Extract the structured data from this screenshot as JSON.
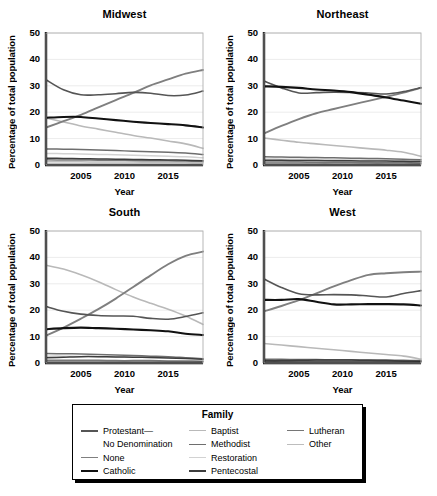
{
  "figure": {
    "ylabel": "Percentage of total population",
    "xlabel": "Year",
    "legend_title": "Family"
  },
  "axes": {
    "yticks": [
      "0",
      "10",
      "20",
      "30",
      "40",
      "50"
    ],
    "xticks": [
      "2005",
      "2010",
      "2015"
    ],
    "ylim": [
      0,
      50
    ],
    "xlim": [
      2001,
      2019
    ]
  },
  "legend": {
    "columns": [
      {
        "items": [
          {
            "label": "Protestant—",
            "label2": "No Denomination",
            "color": "#555555",
            "width": 2.0
          },
          {
            "label": "None",
            "color": "#7f7f7f",
            "width": 1.8
          },
          {
            "label": "Catholic",
            "color": "#111111",
            "width": 2.2
          }
        ]
      },
      {
        "items": [
          {
            "label": "Baptist",
            "color": "#b9b9b9",
            "width": 1.8
          },
          {
            "label": "Methodist",
            "color": "#6e6e6e",
            "width": 1.8
          },
          {
            "label": "Restoration",
            "color": "#d2d2d2",
            "width": 1.8
          },
          {
            "label": "Pentecostal",
            "color": "#3d3d3d",
            "width": 2.0
          }
        ]
      },
      {
        "items": [
          {
            "label": "Lutheran",
            "color": "#767676",
            "width": 1.8
          },
          {
            "label": "Other",
            "color": "#bdbdbd",
            "width": 1.8
          }
        ]
      }
    ]
  },
  "chart_data": {
    "type": "line",
    "title": "",
    "xlabel": "Year",
    "ylabel": "Percentage of total population",
    "xlim": [
      2001,
      2019
    ],
    "ylim": [
      0,
      50
    ],
    "grid": true,
    "legend_position": "bottom",
    "facets": [
      "Midwest",
      "Northeast",
      "South",
      "West"
    ],
    "x": [
      2001,
      2003,
      2005,
      2007,
      2009,
      2011,
      2013,
      2015,
      2017,
      2019
    ],
    "panels": [
      {
        "facet": "Midwest",
        "series": [
          {
            "name": "Protestant—No Denomination",
            "color": "#555555",
            "width": 1.6,
            "values": [
              32.3,
              28.5,
              26.6,
              26.6,
              27.0,
              27.5,
              27.2,
              26.3,
              26.5,
              28.0
            ]
          },
          {
            "name": "None",
            "color": "#7f7f7f",
            "width": 1.9,
            "values": [
              14.2,
              16.6,
              19.0,
              21.8,
              24.6,
              27.3,
              30.2,
              32.4,
              34.6,
              36.0
            ]
          },
          {
            "name": "Catholic",
            "color": "#111111",
            "width": 2.1,
            "values": [
              17.9,
              18.2,
              18.2,
              17.6,
              17.0,
              16.4,
              15.9,
              15.5,
              15.0,
              14.2
            ]
          },
          {
            "name": "Baptist",
            "color": "#b9b9b9",
            "width": 1.6,
            "values": [
              17.8,
              16.3,
              14.8,
              13.6,
              12.4,
              11.2,
              10.2,
              9.1,
              8.0,
              6.3
            ]
          },
          {
            "name": "Methodist",
            "color": "#6e6e6e",
            "width": 1.5,
            "values": [
              6.1,
              6.0,
              5.9,
              5.7,
              5.5,
              5.2,
              5.0,
              4.8,
              4.5,
              4.0
            ]
          },
          {
            "name": "Restoration",
            "color": "#d2d2d2",
            "width": 1.5,
            "values": [
              4.4,
              4.3,
              4.2,
              4.0,
              3.9,
              3.7,
              3.5,
              3.3,
              3.1,
              2.7
            ]
          },
          {
            "name": "Pentecostal",
            "color": "#3d3d3d",
            "width": 1.5,
            "values": [
              2.6,
              2.5,
              2.4,
              2.3,
              2.2,
              2.1,
              2.0,
              1.9,
              1.8,
              1.6
            ]
          },
          {
            "name": "Lutheran",
            "color": "#767676",
            "width": 1.5,
            "values": [
              2.0,
              1.9,
              1.9,
              1.8,
              1.8,
              1.7,
              1.6,
              1.6,
              1.5,
              1.4
            ]
          },
          {
            "name": "Other",
            "color": "#bdbdbd",
            "width": 1.5,
            "values": [
              1.2,
              1.2,
              1.2,
              1.1,
              1.1,
              1.1,
              1.0,
              1.0,
              1.0,
              0.9
            ]
          }
        ]
      },
      {
        "facet": "Northeast",
        "series": [
          {
            "name": "Protestant—No Denomination",
            "color": "#555555",
            "width": 1.6,
            "values": [
              31.8,
              29.2,
              27.3,
              27.4,
              27.6,
              27.5,
              27.3,
              26.9,
              27.8,
              29.3
            ]
          },
          {
            "name": "None",
            "color": "#7f7f7f",
            "width": 1.9,
            "values": [
              12.0,
              14.8,
              17.4,
              19.6,
              21.2,
              22.8,
              24.3,
              25.8,
              27.4,
              29.2
            ]
          },
          {
            "name": "Catholic",
            "color": "#111111",
            "width": 2.1,
            "values": [
              29.8,
              29.6,
              29.2,
              28.6,
              28.2,
              27.6,
              26.6,
              25.6,
              24.4,
              23.2
            ]
          },
          {
            "name": "Baptist",
            "color": "#b9b9b9",
            "width": 1.6,
            "values": [
              10.2,
              9.4,
              8.6,
              8.0,
              7.4,
              6.8,
              6.2,
              5.6,
              4.8,
              3.3
            ]
          },
          {
            "name": "Methodist",
            "color": "#6e6e6e",
            "width": 1.5,
            "values": [
              3.1,
              3.0,
              2.9,
              2.8,
              2.7,
              2.6,
              2.5,
              2.4,
              2.2,
              2.0
            ]
          },
          {
            "name": "Restoration",
            "color": "#d2d2d2",
            "width": 1.5,
            "values": [
              2.3,
              2.2,
              2.2,
              2.1,
              2.0,
              1.9,
              1.9,
              1.8,
              1.7,
              1.6
            ]
          },
          {
            "name": "Pentecostal",
            "color": "#3d3d3d",
            "width": 1.5,
            "values": [
              1.8,
              1.8,
              1.7,
              1.7,
              1.6,
              1.6,
              1.5,
              1.5,
              1.4,
              1.3
            ]
          },
          {
            "name": "Lutheran",
            "color": "#767676",
            "width": 1.5,
            "values": [
              1.1,
              1.1,
              1.1,
              1.0,
              1.0,
              1.0,
              0.9,
              0.9,
              0.9,
              0.8
            ]
          },
          {
            "name": "Other",
            "color": "#bdbdbd",
            "width": 1.5,
            "values": [
              0.7,
              0.7,
              0.7,
              0.7,
              0.6,
              0.6,
              0.6,
              0.6,
              0.6,
              0.5
            ]
          }
        ]
      },
      {
        "facet": "South",
        "series": [
          {
            "name": "Protestant—No Denomination",
            "color": "#555555",
            "width": 1.6,
            "values": [
              21.4,
              19.6,
              18.5,
              18.0,
              17.8,
              17.7,
              16.9,
              16.6,
              17.6,
              19.0
            ]
          },
          {
            "name": "None",
            "color": "#7f7f7f",
            "width": 1.9,
            "values": [
              10.4,
              13.4,
              16.8,
              20.4,
              24.4,
              28.8,
              33.2,
              37.4,
              40.6,
              42.2
            ]
          },
          {
            "name": "Catholic",
            "color": "#111111",
            "width": 2.1,
            "values": [
              12.8,
              13.2,
              13.4,
              13.2,
              13.0,
              12.7,
              12.4,
              12.0,
              11.1,
              10.6
            ]
          },
          {
            "name": "Baptist",
            "color": "#b9b9b9",
            "width": 1.6,
            "values": [
              37.0,
              35.6,
              33.4,
              30.8,
              27.8,
              25.0,
              22.6,
              20.4,
              17.8,
              14.6
            ]
          },
          {
            "name": "Methodist",
            "color": "#6e6e6e",
            "width": 1.5,
            "values": [
              3.6,
              3.5,
              3.4,
              3.2,
              3.0,
              2.8,
              2.6,
              2.4,
              2.0,
              1.6
            ]
          },
          {
            "name": "Restoration",
            "color": "#d2d2d2",
            "width": 1.5,
            "values": [
              2.6,
              2.6,
              2.5,
              2.4,
              2.3,
              2.2,
              2.1,
              2.0,
              1.8,
              1.5
            ]
          },
          {
            "name": "Pentecostal",
            "color": "#3d3d3d",
            "width": 1.5,
            "values": [
              2.0,
              2.2,
              2.4,
              2.4,
              2.3,
              2.2,
              2.1,
              1.9,
              1.7,
              1.4
            ]
          },
          {
            "name": "Lutheran",
            "color": "#767676",
            "width": 1.5,
            "values": [
              1.0,
              1.0,
              1.0,
              1.0,
              0.9,
              0.9,
              0.9,
              0.8,
              0.8,
              0.7
            ]
          },
          {
            "name": "Other",
            "color": "#bdbdbd",
            "width": 1.5,
            "values": [
              0.7,
              0.7,
              0.7,
              0.7,
              0.6,
              0.6,
              0.6,
              0.6,
              0.5,
              0.5
            ]
          }
        ]
      },
      {
        "facet": "West",
        "series": [
          {
            "name": "Protestant—No Denomination",
            "color": "#555555",
            "width": 1.6,
            "values": [
              31.8,
              28.6,
              26.2,
              25.8,
              25.9,
              25.8,
              25.4,
              25.0,
              26.3,
              27.4
            ]
          },
          {
            "name": "None",
            "color": "#7f7f7f",
            "width": 1.9,
            "values": [
              19.6,
              21.6,
              23.8,
              26.4,
              29.0,
              31.4,
              33.4,
              34.0,
              34.4,
              34.6
            ]
          },
          {
            "name": "Catholic",
            "color": "#111111",
            "width": 2.1,
            "values": [
              23.9,
              23.9,
              24.2,
              23.2,
              22.2,
              22.2,
              22.3,
              22.3,
              22.2,
              21.8
            ]
          },
          {
            "name": "Baptist",
            "color": "#b9b9b9",
            "width": 1.6,
            "values": [
              7.4,
              6.8,
              6.2,
              5.6,
              5.0,
              4.4,
              3.8,
              3.2,
              2.6,
              1.5
            ]
          },
          {
            "name": "Methodist",
            "color": "#6e6e6e",
            "width": 1.5,
            "values": [
              1.4,
              1.4,
              1.3,
              1.3,
              1.2,
              1.2,
              1.1,
              1.1,
              1.0,
              0.9
            ]
          },
          {
            "name": "Restoration",
            "color": "#d2d2d2",
            "width": 1.5,
            "values": [
              1.1,
              1.1,
              1.0,
              1.0,
              1.0,
              0.9,
              0.9,
              0.9,
              0.8,
              0.8
            ]
          },
          {
            "name": "Pentecostal",
            "color": "#3d3d3d",
            "width": 1.5,
            "values": [
              0.9,
              0.9,
              1.0,
              1.1,
              1.1,
              1.1,
              1.0,
              0.9,
              0.8,
              0.7
            ]
          },
          {
            "name": "Lutheran",
            "color": "#767676",
            "width": 1.5,
            "values": [
              0.7,
              0.7,
              0.7,
              0.7,
              0.6,
              0.6,
              0.6,
              0.6,
              0.5,
              0.5
            ]
          },
          {
            "name": "Other",
            "color": "#bdbdbd",
            "width": 1.5,
            "values": [
              0.5,
              0.5,
              0.5,
              0.5,
              0.5,
              0.4,
              0.4,
              0.4,
              0.4,
              0.4
            ]
          }
        ]
      }
    ]
  }
}
